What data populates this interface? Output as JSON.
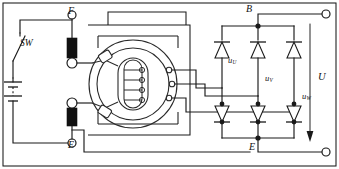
{
  "diagram": {
    "type": "schematic",
    "width": 339,
    "height": 169,
    "background_color": "#ffffff",
    "line_color": "#1a1a1a"
  },
  "labels": {
    "field_terminal": "F",
    "switch": "SW",
    "ground_terminal_left": "E",
    "battery_terminal": "B",
    "ground_terminal_right": "E",
    "output_voltage": "U",
    "phase_u": {
      "symbol": "u",
      "subscript": "U"
    },
    "phase_v": {
      "symbol": "u",
      "subscript": "V"
    },
    "phase_w": {
      "symbol": "u",
      "subscript": "W"
    }
  },
  "components": {
    "switch": {
      "name": "SW",
      "state": "open",
      "type": "single-pole"
    },
    "battery": {
      "type": "multi-cell",
      "plates": 4,
      "orientation": "vertical"
    },
    "brushes": [
      {
        "name": "field-brush-top",
        "connects_to": "F"
      },
      {
        "name": "field-brush-bottom",
        "connects_to": "E"
      }
    ],
    "slip_rings": 2,
    "rotor_field_coil": {
      "turns": 4,
      "shape": "vertical-oval"
    },
    "stator": {
      "phases": 3,
      "phase_names": [
        "U",
        "V",
        "W"
      ]
    },
    "rectifier": {
      "type": "three-phase full-wave bridge",
      "diode_count": 6,
      "positive_diodes": 3,
      "negative_diodes": 3,
      "positive_bus": "B",
      "negative_bus": "E"
    },
    "output_terminals": [
      {
        "name": "positive-output",
        "position": "top-right"
      },
      {
        "name": "negative-output",
        "position": "bottom-right"
      }
    ]
  }
}
